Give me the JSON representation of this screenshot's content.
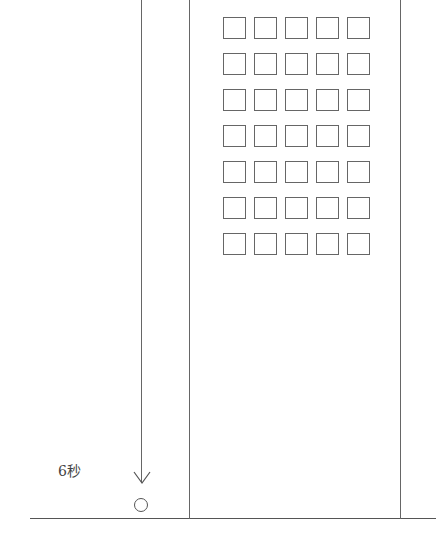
{
  "diagram": {
    "type": "physics-free-fall",
    "label_time": "6秒",
    "building": {
      "window_rows": 7,
      "window_cols": 5
    },
    "elements": [
      "building",
      "falling-object-ball",
      "downward-arrow",
      "ground-line"
    ]
  }
}
